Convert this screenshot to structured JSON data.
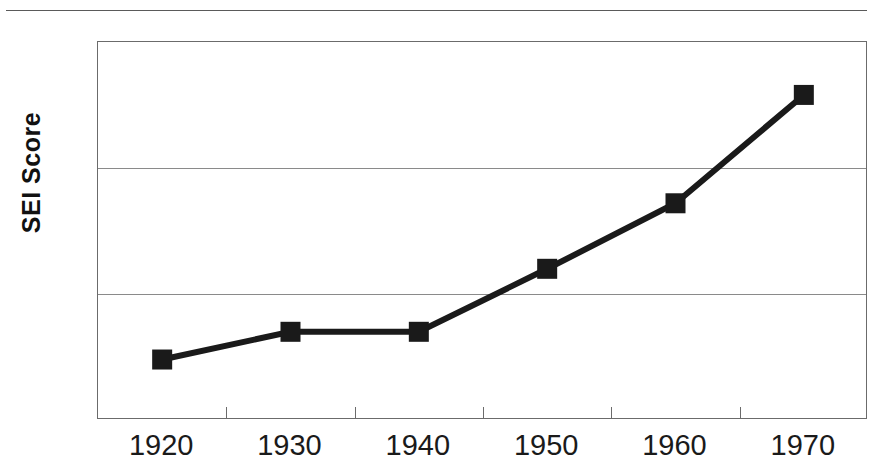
{
  "figure": {
    "width": 873,
    "height": 471,
    "background": "#ffffff",
    "has_top_rule": true
  },
  "chart_data": {
    "type": "line",
    "title": "",
    "subtitle": "",
    "xlabel": "",
    "ylabel": "SEI Score",
    "categories": [
      "1920",
      "1930",
      "1940",
      "1950",
      "1960",
      "1970"
    ],
    "x": [
      1920,
      1930,
      1940,
      1950,
      1960,
      1970
    ],
    "values": [
      27.4,
      28.5,
      28.5,
      31.0,
      33.6,
      37.9
    ],
    "series": [
      {
        "name": "SEI Score",
        "values": [
          27.4,
          28.5,
          28.5,
          31.0,
          33.6,
          37.9
        ],
        "color": "#1a1a1a",
        "marker": "square",
        "line_width": 6
      }
    ],
    "ylim": [
      25,
      40
    ],
    "ytick_labels": [
      "25",
      "30",
      "35",
      "40"
    ],
    "ytick_values": [
      25,
      30,
      35,
      40
    ],
    "xtick_labels": [
      "1920",
      "1930",
      "1940",
      "1950",
      "1960",
      "1970"
    ],
    "grid": "horizontal",
    "gridlines_at": [
      30,
      35
    ],
    "legend": "none",
    "annotations": []
  },
  "axes": {
    "y_title": "SEI Score",
    "y_labels": [
      {
        "text": "40",
        "value": 40
      },
      {
        "text": "35",
        "value": 35
      },
      {
        "text": "30",
        "value": 30
      },
      {
        "text": "25",
        "value": 25
      }
    ],
    "x_labels": [
      {
        "text": "1920",
        "value": 1920
      },
      {
        "text": "1930",
        "value": 1930
      },
      {
        "text": "1940",
        "value": 1940
      },
      {
        "text": "1950",
        "value": 1950
      },
      {
        "text": "1960",
        "value": 1960
      },
      {
        "text": "1970",
        "value": 1970
      }
    ]
  },
  "colors": {
    "line": "#1a1a1a",
    "marker": "#1a1a1a",
    "frame": "#6b6b6b",
    "gridline": "#8a8a8a",
    "text": "#1a1a1a",
    "background": "#ffffff"
  }
}
